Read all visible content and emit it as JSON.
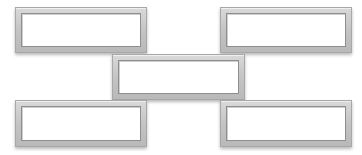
{
  "diagram": {
    "type": "staggered-boxes",
    "colors": {
      "background": "#ffffff",
      "frame": "#c4c4c4",
      "frame_border": "#a8a8a8",
      "inner_border": "#8e8e8e",
      "fill": "#ffffff"
    },
    "boxes": [
      {
        "id": "box-top-left",
        "label": "",
        "x": 15,
        "y": 7,
        "w": 132,
        "h": 46
      },
      {
        "id": "box-top-right",
        "label": "",
        "x": 220,
        "y": 7,
        "w": 132,
        "h": 46
      },
      {
        "id": "box-center",
        "label": "",
        "x": 112,
        "y": 54,
        "w": 133,
        "h": 46
      },
      {
        "id": "box-bottom-left",
        "label": "",
        "x": 15,
        "y": 100,
        "w": 132,
        "h": 47
      },
      {
        "id": "box-bottom-right",
        "label": "",
        "x": 220,
        "y": 100,
        "w": 132,
        "h": 47
      }
    ]
  }
}
